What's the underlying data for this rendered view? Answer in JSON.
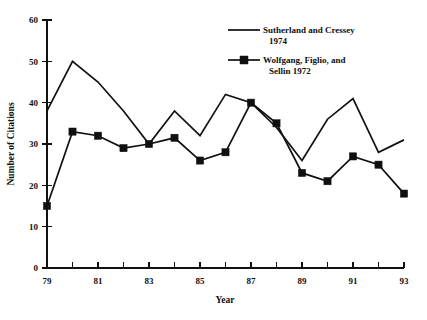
{
  "chart_data": {
    "type": "line",
    "title": "",
    "subtitle": "",
    "xlabel": "Year",
    "ylabel": "Number of Citations",
    "x": [
      79,
      80,
      81,
      82,
      83,
      84,
      85,
      86,
      87,
      88,
      89,
      90,
      91,
      92,
      93
    ],
    "x_tick_labels": [
      "79",
      "",
      "81",
      "",
      "83",
      "",
      "85",
      "",
      "87",
      "",
      "89",
      "",
      "91",
      "",
      "93"
    ],
    "x_major_labels": [
      "79",
      "81",
      "83",
      "85",
      "87",
      "89",
      "91",
      "93"
    ],
    "xlim": [
      79,
      93
    ],
    "ylim": [
      0,
      60
    ],
    "y_ticks": [
      0,
      10,
      20,
      30,
      40,
      50,
      60
    ],
    "y_tick_labels": [
      "0",
      "10",
      "20",
      "30",
      "40",
      "50",
      "60"
    ],
    "grid": false,
    "legend_position": "top-right",
    "series": [
      {
        "name": "Sutherland and Cressey 1974",
        "marker": "none",
        "values": [
          38,
          50,
          45,
          38,
          30,
          38,
          32,
          42,
          40,
          34,
          26,
          36,
          41,
          28,
          31
        ]
      },
      {
        "name": "Wolfgang, Figlio, and Sellin 1972",
        "marker": "filled-square",
        "values": [
          15,
          33,
          32,
          29,
          30,
          31.5,
          26,
          28,
          40,
          35,
          23,
          21,
          27,
          25,
          18
        ]
      }
    ]
  },
  "legend": {
    "entries": [
      {
        "line1": "Sutherland and Cressey",
        "line2": "1974",
        "marker": "none"
      },
      {
        "line1": "Wolfgang, Figlio, and",
        "line2": "Sellin 1972",
        "marker": "filled-square"
      }
    ]
  },
  "colors": {
    "ink": "#101010",
    "background": "#ffffff"
  }
}
